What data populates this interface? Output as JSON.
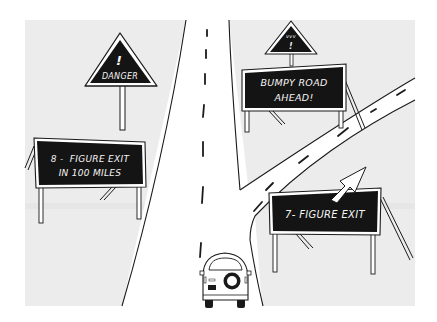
{
  "illustration": {
    "description": "Cartoon of a highway with an exit ramp and road signs; a car drives along the main road",
    "colors": {
      "background": "#ffffff",
      "panel": "#ececec",
      "road": "#ffffff",
      "ink": "#1a1a1a",
      "sign_board": "#141414",
      "sign_text": "#f4f4f4"
    },
    "signs": {
      "danger": {
        "text": "DANGER",
        "glyph": "!"
      },
      "bumpy": {
        "glyph_top": "vvv",
        "glyph": "!",
        "line1": "BUMPY ROAD",
        "line2": "AHEAD!"
      },
      "exit8": {
        "line1": "8 -  FIGURE EXIT",
        "line2": "IN 100 MILES"
      },
      "exit7": {
        "line1": "7- FIGURE EXIT",
        "arrow": "arrow-up-right"
      }
    },
    "vehicle": {
      "type": "suv",
      "view": "rear",
      "feature": "spare-tire"
    }
  }
}
